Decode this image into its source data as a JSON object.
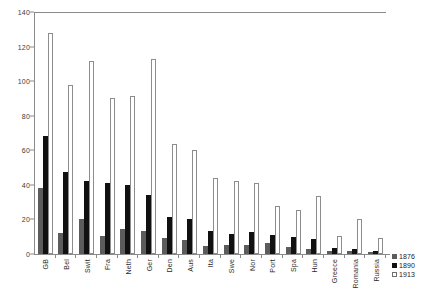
{
  "chart_data": {
    "type": "bar",
    "title": "",
    "xlabel": "",
    "ylabel": "",
    "ylim": [
      0,
      140
    ],
    "ytick_step": 20,
    "yticks": [
      0,
      20,
      40,
      60,
      80,
      100,
      120,
      140
    ],
    "grid": false,
    "legend_position": "bottom-right",
    "categories": [
      "GB",
      "Bel",
      "Swit",
      "Fra",
      "Neth",
      "Ger",
      "Den",
      "Aus",
      "Ita",
      "Swe",
      "Nor",
      "Port",
      "Spa",
      "Hun",
      "Greece",
      "Romania",
      "Russia"
    ],
    "series": [
      {
        "name": "1876",
        "color": "#5c5c5c",
        "values": [
          38,
          12,
          20.5,
          10.5,
          14.5,
          13.5,
          9,
          8,
          4.5,
          5.5,
          5,
          6.5,
          4,
          3,
          1.5,
          1.5,
          1
        ]
      },
      {
        "name": "1890",
        "color": "#111111",
        "values": [
          68,
          47.5,
          42,
          41,
          40,
          34,
          21.5,
          20,
          13.5,
          11.5,
          12.5,
          11,
          10,
          8.5,
          3.5,
          3,
          2
        ]
      },
      {
        "name": "1913",
        "color": "#ffffff",
        "values": [
          128,
          98,
          111.5,
          90.5,
          91.5,
          113,
          63.5,
          60,
          44,
          42,
          41,
          28,
          25.5,
          33.5,
          10.5,
          20,
          9
        ]
      }
    ]
  },
  "legend": {
    "entries": [
      {
        "label": "1876"
      },
      {
        "label": "1890"
      },
      {
        "label": "1913"
      }
    ]
  }
}
